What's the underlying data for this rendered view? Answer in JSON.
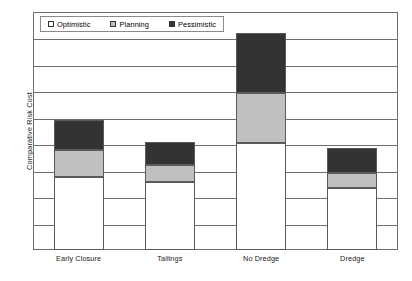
{
  "chart_data": {
    "type": "bar",
    "stacked": true,
    "title": "",
    "xlabel": "",
    "ylabel": "Comparative Risk Cost",
    "categories": [
      "Early Closure",
      "Tailings",
      "No Dredge",
      "Dredge"
    ],
    "series": [
      {
        "name": "Optimistic",
        "color": "#ffffff",
        "values": [
          2.72,
          2.53,
          4.0,
          2.31
        ]
      },
      {
        "name": "Planning",
        "color": "#c0c0c0",
        "values": [
          1.01,
          0.63,
          1.87,
          0.56
        ]
      },
      {
        "name": "Pessimistic",
        "color": "#333333",
        "values": [
          1.12,
          0.86,
          2.24,
          0.93
        ]
      }
    ],
    "totals": [
      4.85,
      4.02,
      8.11,
      3.8
    ],
    "ylim": [
      0,
      8.88
    ],
    "y_tick_labels": [],
    "gridlines": 8,
    "grid": true,
    "legend_position": "top-left",
    "axis_values_shown": false
  },
  "legend": {
    "items": [
      {
        "label": "Optimistic"
      },
      {
        "label": "Planning"
      },
      {
        "label": "Pessimistic"
      }
    ]
  },
  "axes": {
    "y_title": "Comparative Risk Cost"
  }
}
